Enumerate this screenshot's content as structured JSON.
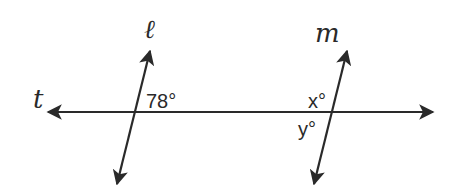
{
  "diagram": {
    "type": "parallel-lines-transversal",
    "stroke_color": "#2a2a2a",
    "background": "#ffffff",
    "lines": [
      {
        "name": "t",
        "label": "t",
        "role": "transversal",
        "from": [
          44,
          112
        ],
        "to": [
          437,
          112
        ]
      },
      {
        "name": "l",
        "label": "ℓ",
        "role": "line",
        "from": [
          116,
          188
        ],
        "to": [
          151,
          47
        ]
      },
      {
        "name": "m",
        "label": "m",
        "role": "line",
        "from": [
          313,
          188
        ],
        "to": [
          348,
          47
        ]
      }
    ],
    "angles": [
      {
        "label": "78°",
        "at_intersection": "l-t",
        "position": "above-right"
      },
      {
        "label": "x°",
        "at_intersection": "m-t",
        "position": "above-left"
      },
      {
        "label": "y°",
        "at_intersection": "m-t",
        "position": "below-left"
      }
    ]
  }
}
